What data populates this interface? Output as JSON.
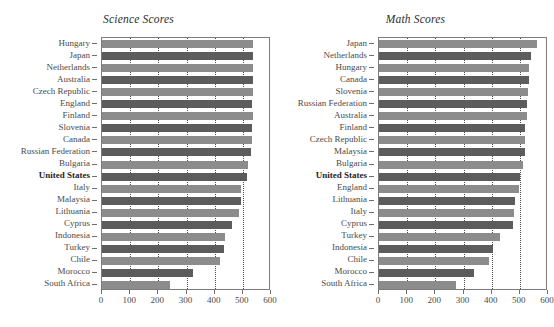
{
  "chart_data": [
    {
      "type": "bar",
      "title": "Science Scores",
      "orientation": "horizontal",
      "xlabel": "",
      "ylabel": "",
      "xlim": [
        0,
        600
      ],
      "xticks": [
        0,
        100,
        200,
        300,
        400,
        500,
        600
      ],
      "grid": "vertical-dotted",
      "legend": "none",
      "highlight_category": "United States",
      "colors": {
        "light": "#8c8c8c",
        "dark": "#5c5c5c"
      },
      "categories": [
        "Hungary",
        "Japan",
        "Netherlands",
        "Australia",
        "Czech Republic",
        "England",
        "Finland",
        "Slovenia",
        "Canada",
        "Russian Federation",
        "Bulgaria",
        "United States",
        "Italy",
        "Malaysia",
        "Lithuania",
        "Cyprus",
        "Indonesia",
        "Turkey",
        "Chile",
        "Morocco",
        "South Africa"
      ],
      "values": [
        537,
        536,
        536,
        535,
        535,
        533,
        535,
        533,
        533,
        529,
        518,
        515,
        493,
        492,
        488,
        460,
        435,
        433,
        420,
        323,
        243
      ]
    },
    {
      "type": "bar",
      "title": "Math Scores",
      "orientation": "horizontal",
      "xlabel": "",
      "ylabel": "",
      "xlim": [
        0,
        600
      ],
      "xticks": [
        0,
        100,
        200,
        300,
        400,
        500,
        600
      ],
      "grid": "vertical-dotted",
      "legend": "none",
      "highlight_category": "United States",
      "colors": {
        "light": "#8c8c8c",
        "dark": "#5c5c5c"
      },
      "categories": [
        "Japan",
        "Netherlands",
        "Hungary",
        "Canada",
        "Slovenia",
        "Russian Federation",
        "Australia",
        "Finland",
        "Czech Republic",
        "Malaysia",
        "Bulgaria",
        "United States",
        "England",
        "Lithuania",
        "Italy",
        "Cyprus",
        "Turkey",
        "Indonesia",
        "Chile",
        "Morocco",
        "South Africa"
      ],
      "values": [
        561,
        540,
        532,
        531,
        530,
        526,
        525,
        520,
        520,
        519,
        511,
        502,
        496,
        482,
        479,
        476,
        429,
        403,
        392,
        337,
        275
      ]
    }
  ]
}
